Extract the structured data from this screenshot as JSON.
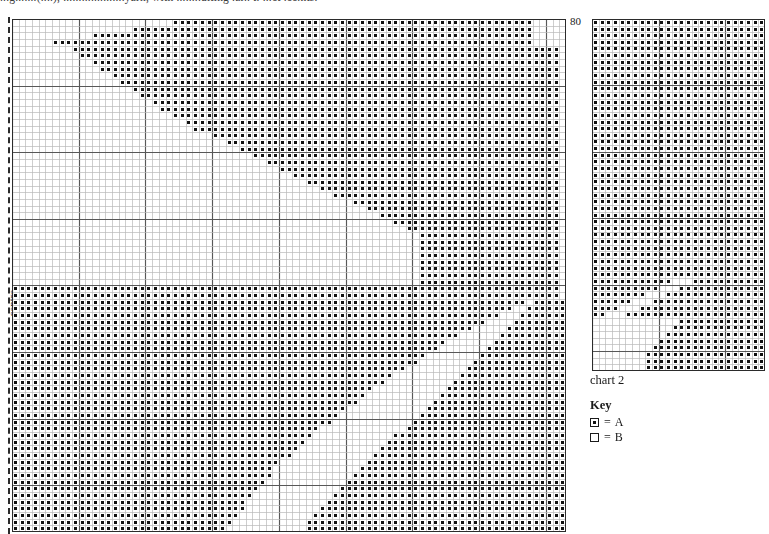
{
  "header": {
    "cropped_text": "...g.......(....), ....................yarn, with ........ulting .ar.. t. ...ct .cc.nts."
  },
  "chart1": {
    "name": "main-chart",
    "tick_label": "80",
    "centre_label": "centre",
    "columns": 83,
    "rows": 77,
    "cell_px": 6.67,
    "heavy_every": 10,
    "grid_color": "#b9b9b9",
    "heavy_color": "#585858",
    "border_color": "#2b2b2b",
    "symbol_color": "#111111",
    "symbol": "A",
    "pattern_note": "large diagonal zigzag motif, filled blocks top band, open V-channels through middle, dense lower-left block"
  },
  "chart2": {
    "name": "secondary-chart",
    "label": "chart 2",
    "columns": 26,
    "rows": 53,
    "cell_px": 6.67,
    "heavy_every": 10,
    "grid_color": "#b9b9b9",
    "heavy_color": "#585858",
    "border_color": "#2b2b2b",
    "symbol_color": "#111111",
    "symbol": "A",
    "pattern_note": "solid filled upper two thirds, stepped diagonal break, filled lower-right wedge"
  },
  "key": {
    "title": "Key",
    "entries": [
      {
        "swatch": "filled",
        "equals": "=",
        "label": "A"
      },
      {
        "swatch": "empty",
        "equals": "=",
        "label": "B"
      }
    ]
  },
  "chart_data": {
    "type": "heatmap",
    "title": "chart 2",
    "xlabel": "",
    "ylabel": "centre",
    "legend": [
      "A",
      "B"
    ],
    "charts": [
      {
        "name": "chart 1",
        "cols": 83,
        "rows": 77,
        "tick_labels": [
          "80"
        ],
        "fill_regions": [
          {
            "shape": "band",
            "desc": "rows 0-3 fully filled from col 24 rightwards, stepping left to col 4 by row 3"
          },
          {
            "shape": "diagonal",
            "desc": "rows 4-16 left boundary steps right from col 10 to col 28"
          },
          {
            "shape": "wedge",
            "desc": "rows 17-30 open V channel sweeping right to col 62"
          },
          {
            "shape": "block",
            "desc": "rows 42-77 dense fill cols 0-40 with stepped right edge"
          },
          {
            "shape": "wedge",
            "desc": "rows 55-77 filled wedge cols 52-83"
          }
        ]
      },
      {
        "name": "chart 2",
        "cols": 26,
        "rows": 53,
        "fill_regions": [
          {
            "shape": "block",
            "desc": "rows 0-38 fully filled"
          },
          {
            "shape": "steps",
            "desc": "rows 39-44 stepped boundary descending left-to-right"
          },
          {
            "shape": "wedge",
            "desc": "rows 45-53 filled wedge on right half"
          }
        ]
      }
    ]
  }
}
